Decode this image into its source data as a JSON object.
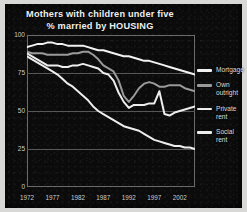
{
  "chart_data": {
    "type": "line",
    "title": "Mothers with children under five",
    "subtitle": "% married by HOUSING",
    "xlabel": "",
    "ylabel": "",
    "xlim": [
      1972,
      2005
    ],
    "ylim": [
      0,
      100
    ],
    "yticks": [
      0,
      25,
      50,
      75,
      100
    ],
    "ytick_labels": [
      "0",
      "25",
      "50",
      "75",
      "100"
    ],
    "xticks": [
      1972,
      1977,
      1982,
      1987,
      1992,
      1997,
      2002
    ],
    "xtick_labels": [
      "1972",
      "1977",
      "1982",
      "1987",
      "1992",
      "1997",
      "2002"
    ],
    "grid": "horizontal",
    "legend_position": "right",
    "background": "#0b0b0b",
    "x": [
      1972,
      1973,
      1974,
      1975,
      1976,
      1977,
      1978,
      1979,
      1980,
      1981,
      1982,
      1983,
      1984,
      1985,
      1986,
      1987,
      1988,
      1989,
      1990,
      1991,
      1992,
      1993,
      1994,
      1995,
      1996,
      1997,
      1998,
      1999,
      2000,
      2001,
      2002,
      2003,
      2004,
      2005
    ],
    "series": [
      {
        "name": "Mortgage",
        "color": "#f2f2f2",
        "values": [
          92,
          93,
          94,
          94,
          95,
          95,
          94,
          94,
          93,
          93,
          93,
          93,
          92,
          91,
          90,
          90,
          89,
          88,
          87,
          86,
          86,
          85,
          84,
          83,
          83,
          82,
          81,
          80,
          79,
          78,
          77,
          76,
          75,
          74
        ]
      },
      {
        "name": "Own outright",
        "color": "#9a9a9a",
        "values": [
          89,
          88,
          88,
          88,
          87,
          87,
          87,
          87,
          87,
          88,
          88,
          89,
          89,
          87,
          84,
          80,
          78,
          76,
          70,
          60,
          56,
          60,
          65,
          68,
          69,
          68,
          66,
          66,
          67,
          67,
          67,
          65,
          64,
          63
        ]
      },
      {
        "name": "Private rent",
        "color": "#ededed",
        "values": [
          88,
          86,
          84,
          82,
          80,
          80,
          80,
          79,
          79,
          80,
          80,
          81,
          80,
          79,
          78,
          75,
          74,
          70,
          62,
          56,
          52,
          54,
          54,
          54,
          55,
          55,
          63,
          48,
          47,
          49,
          50,
          51,
          52,
          53
        ]
      },
      {
        "name": "Social rent",
        "color": "#ededed",
        "values": [
          86,
          84,
          82,
          80,
          78,
          76,
          74,
          71,
          68,
          66,
          63,
          60,
          57,
          53,
          50,
          48,
          46,
          44,
          42,
          40,
          39,
          38,
          37,
          35,
          33,
          31,
          30,
          29,
          28,
          27,
          27,
          26,
          26,
          25
        ]
      }
    ]
  },
  "legend": {
    "items": [
      {
        "label_line1": "Mortgage",
        "label_line2": ""
      },
      {
        "label_line1": "Own",
        "label_line2": "outright"
      },
      {
        "label_line1": "Private",
        "label_line2": "rent"
      },
      {
        "label_line1": "Social",
        "label_line2": "rent"
      }
    ]
  }
}
